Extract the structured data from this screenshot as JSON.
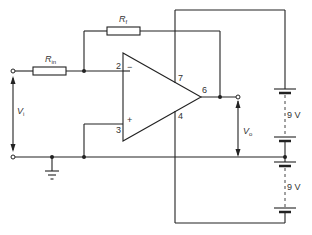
{
  "diagram": {
    "resistors": {
      "rin": {
        "symbol": "R",
        "sub": "in"
      },
      "rf": {
        "symbol": "R",
        "sub": "f"
      }
    },
    "pins": {
      "inverting": "2",
      "non_inverting": "3",
      "output": "6",
      "vplus": "7",
      "vminus": "4"
    },
    "signs": {
      "minus": "−",
      "plus": "+"
    },
    "voltages": {
      "vi": {
        "symbol": "V",
        "sub": "i"
      },
      "vo": {
        "symbol": "V",
        "sub": "o"
      }
    },
    "supplies": {
      "upper": "9 V",
      "lower": "9 V"
    },
    "colors": {
      "line": "#222222",
      "background": "#ffffff"
    }
  }
}
